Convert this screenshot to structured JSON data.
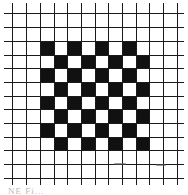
{
  "figure": {
    "background": "#ffffff",
    "line_color": "#1a1a1a",
    "fill_color": "#111111",
    "grid": {
      "vertical_lines_x": [
        12,
        26,
        40,
        54,
        67,
        81,
        95,
        108,
        122,
        136,
        149,
        163,
        177
      ],
      "horizontal_lines_y": [
        13,
        27,
        41,
        55,
        68,
        82,
        96,
        109,
        123,
        137,
        150,
        164,
        178
      ],
      "line_extent_x": [
        4,
        184
      ],
      "line_extent_y": [
        3,
        185
      ]
    },
    "checkerboard": {
      "rows": 8,
      "cols": 8,
      "start_col_index": 2,
      "start_row_index": 2,
      "top_left_filled": true,
      "rule": "filled when (row+col) is even"
    },
    "caption": "NE Fi..."
  }
}
